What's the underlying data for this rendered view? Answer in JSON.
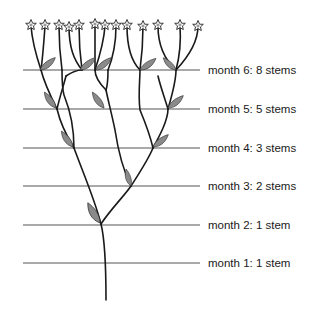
{
  "diagram": {
    "colors": {
      "stem": "#1a1a1a",
      "line": "#555555",
      "leaf": "#8a8a8a",
      "leaf_edge": "#333333",
      "flower_center": "#9a9a9a"
    },
    "rows": [
      {
        "label": "month 6: 8 stems",
        "y": 70
      },
      {
        "label": "month 5: 5 stems",
        "y": 109
      },
      {
        "label": "month 4: 3 stems",
        "y": 148
      },
      {
        "label": "month 3: 2 stems",
        "y": 186
      },
      {
        "label": "month 2: 1 stem",
        "y": 225
      },
      {
        "label": "month 1: 1 stem",
        "y": 263
      }
    ],
    "flower_count": 13
  }
}
